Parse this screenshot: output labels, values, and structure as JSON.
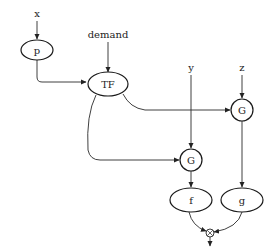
{
  "diagram": {
    "type": "dataflow-graph",
    "inputs": [
      {
        "id": "x",
        "label": "x"
      },
      {
        "id": "demand",
        "label": "demand"
      },
      {
        "id": "y",
        "label": "y"
      },
      {
        "id": "z",
        "label": "z"
      }
    ],
    "nodes": [
      {
        "id": "p",
        "label": "p",
        "shape": "ellipse"
      },
      {
        "id": "TF",
        "label": "TF",
        "shape": "ellipse"
      },
      {
        "id": "G1",
        "label": "G",
        "shape": "circle"
      },
      {
        "id": "G2",
        "label": "G",
        "shape": "circle"
      },
      {
        "id": "f",
        "label": "f",
        "shape": "ellipse"
      },
      {
        "id": "g",
        "label": "g",
        "shape": "ellipse"
      },
      {
        "id": "combine",
        "label": "⊗",
        "shape": "small-circle"
      }
    ],
    "edges": [
      {
        "from": "x",
        "to": "p"
      },
      {
        "from": "p",
        "to": "TF"
      },
      {
        "from": "demand",
        "to": "TF"
      },
      {
        "from": "TF",
        "to": "G1"
      },
      {
        "from": "TF",
        "to": "G2"
      },
      {
        "from": "y",
        "to": "G1"
      },
      {
        "from": "z",
        "to": "G2"
      },
      {
        "from": "G1",
        "to": "f"
      },
      {
        "from": "G2",
        "to": "g"
      },
      {
        "from": "f",
        "to": "combine"
      },
      {
        "from": "g",
        "to": "combine"
      },
      {
        "from": "combine",
        "to": "output"
      }
    ]
  }
}
